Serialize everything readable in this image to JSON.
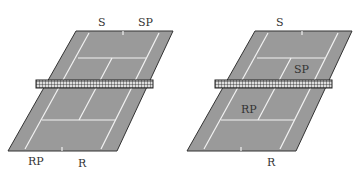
{
  "colors": {
    "court": "#9a9a9a",
    "lines": "#f2f2f2",
    "border": "#333333",
    "net": "#222222",
    "text": "#333333"
  },
  "diagrams": [
    {
      "id": "left-court",
      "labels": {
        "top_center": "S",
        "top_right": "SP",
        "bottom_left": "RP",
        "bottom_center": "R"
      }
    },
    {
      "id": "right-court",
      "labels": {
        "top_center": "S",
        "mid_right": "SP",
        "mid_left": "RP",
        "bottom_center": "R"
      }
    }
  ]
}
